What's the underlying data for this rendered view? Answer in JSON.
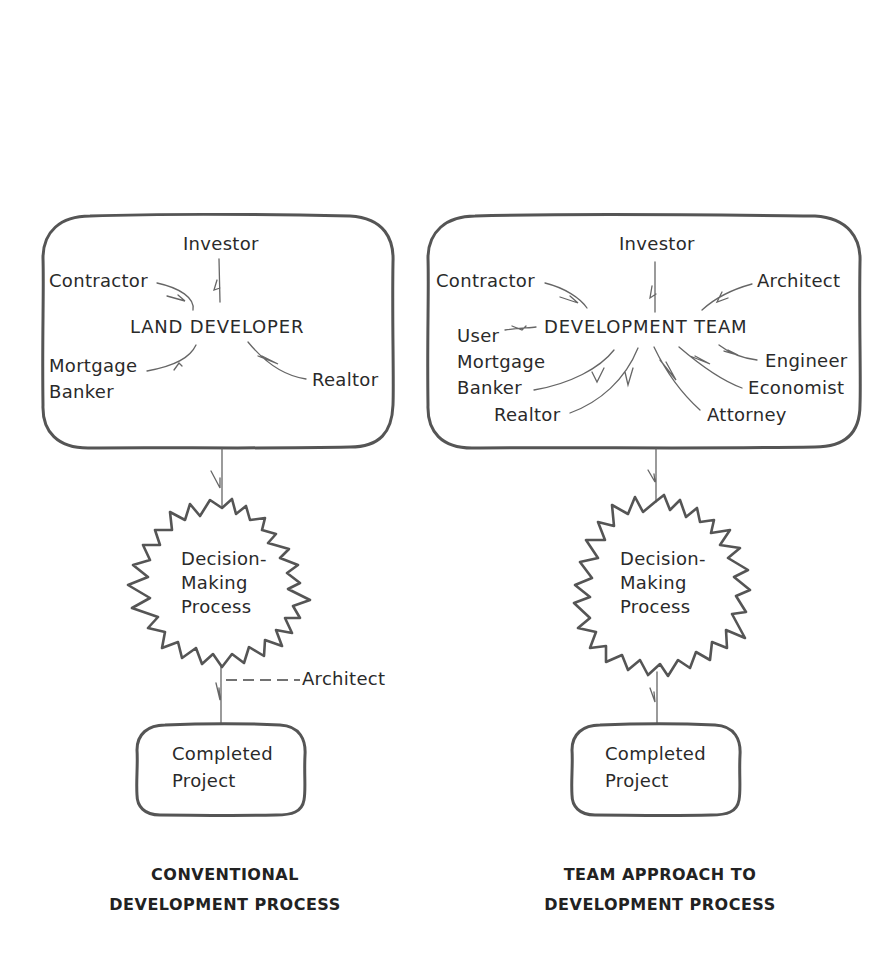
{
  "diagram": {
    "left_panel": {
      "group_box": {
        "center_label": "LAND DEVELOPER",
        "participants": {
          "investor": "Investor",
          "contractor": "Contractor",
          "mortgage_banker": "Mortgage\nBanker",
          "realtor": "Realtor"
        }
      },
      "process": "Decision-\nMaking\nProcess",
      "side_input": "Architect",
      "outcome": "Completed\nProject",
      "caption": {
        "line1": "CONVENTIONAL",
        "line2": "DEVELOPMENT PROCESS"
      }
    },
    "right_panel": {
      "group_box": {
        "center_label": "DEVELOPMENT TEAM",
        "participants": {
          "investor": "Investor",
          "contractor": "Contractor",
          "architect": "Architect",
          "user": "User",
          "mortgage_banker": "Mortgage\nBanker",
          "engineer": "Engineer",
          "economist": "Economist",
          "realtor": "Realtor",
          "attorney": "Attorney"
        }
      },
      "process": "Decision-\nMaking\nProcess",
      "outcome": "Completed\nProject",
      "caption": {
        "line1": "TEAM APPROACH TO",
        "line2": "DEVELOPMENT PROCESS"
      }
    },
    "colors": {
      "stroke": "#555555",
      "text": "#2a2a2a",
      "background": "#ffffff"
    }
  }
}
